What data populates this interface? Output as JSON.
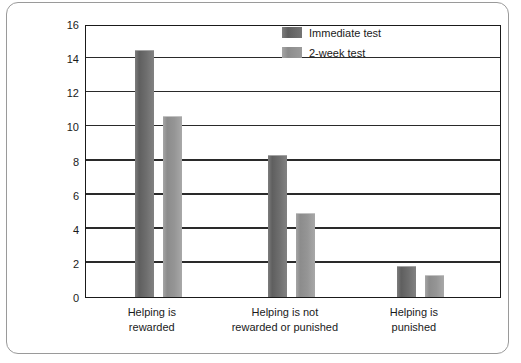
{
  "chart_data": {
    "type": "bar",
    "title": "",
    "xlabel": "",
    "ylabel": "Mean number of tokens donated",
    "ylim": [
      0,
      16
    ],
    "ytick_step": 2,
    "yticks": [
      16,
      14,
      12,
      10,
      8,
      6,
      4,
      2,
      0
    ],
    "grid": true,
    "legend_position": "top-right",
    "categories": [
      "Helping is rewarded",
      "Helping is not rewarded or punished",
      "Helping is punished"
    ],
    "categories_lines": [
      [
        "Helping is",
        "rewarded"
      ],
      [
        "Helping is not",
        "rewarded or punished"
      ],
      [
        "Helping is",
        "punished"
      ]
    ],
    "series": [
      {
        "name": "Immediate test",
        "color": "#6e6e6e",
        "values": [
          14.5,
          8.3,
          1.8
        ]
      },
      {
        "name": "2-week test",
        "color": "#959595",
        "values": [
          10.6,
          4.9,
          1.3
        ]
      }
    ]
  },
  "legend": {
    "items": [
      {
        "label": "Immediate test"
      },
      {
        "label": "2-week test"
      }
    ]
  }
}
